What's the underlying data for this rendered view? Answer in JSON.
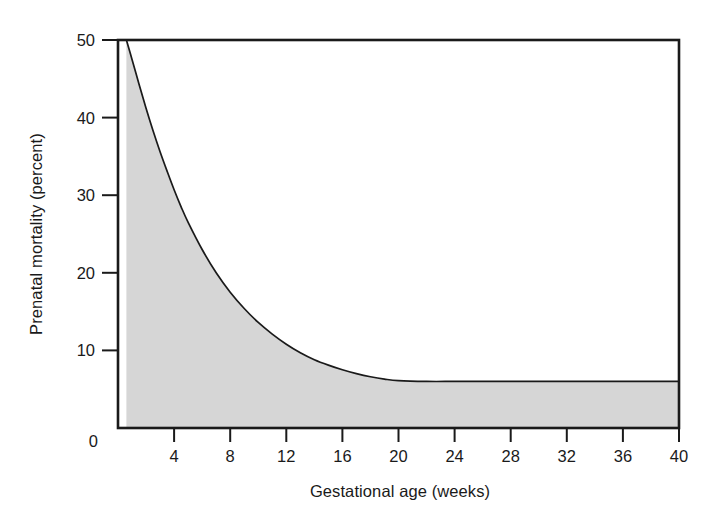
{
  "chart_data": {
    "type": "area",
    "title": "",
    "subtitle": "",
    "xlabel": "Gestational age (weeks)",
    "ylabel": "Prenatal mortality (percent)",
    "xlim": [
      0,
      40
    ],
    "ylim": [
      0,
      50
    ],
    "xticks": [
      0,
      4,
      8,
      12,
      16,
      20,
      24,
      28,
      32,
      36,
      40
    ],
    "xtick_labels": [
      "",
      "4",
      "8",
      "12",
      "16",
      "20",
      "24",
      "28",
      "32",
      "36",
      "40"
    ],
    "yticks": [
      0,
      10,
      20,
      30,
      40,
      50
    ],
    "ytick_labels": [
      "0",
      "10",
      "20",
      "30",
      "40",
      "50"
    ],
    "grid": false,
    "legend": null,
    "legend_position": "none",
    "fill_color": "#d6d6d6",
    "line_color": "#1a1a1a",
    "frame_color": "#1a1a1a",
    "annotations": [
      "Curve declines exponentially from 50 percent near week 1 to an asymptote of about 6 percent from week 20 to week 40",
      "Area beneath the curve is shaded light gray"
    ],
    "series": [
      {
        "name": "Prenatal mortality",
        "x": [
          0.6,
          1,
          1.5,
          2,
          2.5,
          3,
          3.5,
          4,
          4.5,
          5,
          6,
          7,
          8,
          9,
          10,
          11,
          12,
          13,
          14,
          15,
          16,
          17,
          18,
          19,
          20,
          22,
          24,
          26,
          28,
          30,
          32,
          34,
          36,
          38,
          40
        ],
        "values": [
          50,
          47.5,
          44.3,
          41.2,
          38.3,
          35.6,
          33.1,
          30.7,
          28.5,
          26.5,
          23.0,
          20.0,
          17.5,
          15.4,
          13.6,
          12.1,
          10.8,
          9.7,
          8.8,
          8.1,
          7.5,
          7.0,
          6.6,
          6.3,
          6.1,
          6.0,
          6.0,
          6.0,
          6.0,
          6.0,
          6.0,
          6.0,
          6.0,
          6.0,
          6.0
        ]
      }
    ]
  },
  "axes": {
    "x_title": "Gestational age (weeks)",
    "y_title": "Prenatal mortality (percent)",
    "x_tick_labels": [
      "4",
      "8",
      "12",
      "16",
      "20",
      "24",
      "28",
      "32",
      "36",
      "40"
    ],
    "y_tick_labels": [
      "0",
      "10",
      "20",
      "30",
      "40",
      "50"
    ]
  }
}
